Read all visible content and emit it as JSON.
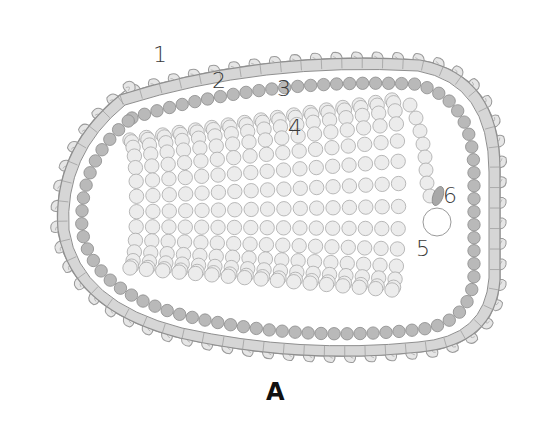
{
  "figure": {
    "label": "A"
  },
  "labels": [
    {
      "id": "1",
      "text": "1",
      "part": "surface glycoprotein spikes"
    },
    {
      "id": "2",
      "text": "2",
      "part": "lipid envelope"
    },
    {
      "id": "3",
      "text": "3",
      "part": "matrix protein layer"
    },
    {
      "id": "4",
      "text": "4",
      "part": "helical nucleocapsid"
    },
    {
      "id": "5",
      "text": "5",
      "part": "nucleocapsid end / polymerase"
    },
    {
      "id": "6",
      "text": "6",
      "part": "phosphoprotein"
    }
  ],
  "colors": {
    "spike_fill": "#e6e6e6",
    "spike_stroke": "#9a9a9a",
    "envelope_fill": "#d6d6d6",
    "envelope_stroke": "#8f8f8f",
    "matrix_fill": "#b9b9b9",
    "matrix_stroke": "#8a8a8a",
    "capsid_fill": "#ececec",
    "capsid_stroke": "#a8a8a8",
    "protein6_fill": "#a8a8a8",
    "label_color": "#3a3a3a"
  }
}
